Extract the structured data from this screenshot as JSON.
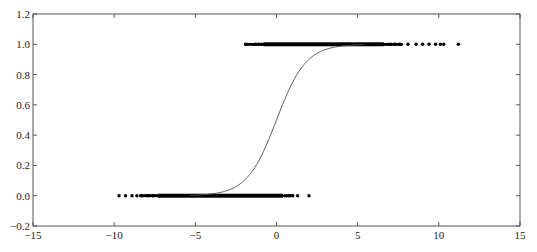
{
  "chart_data": {
    "type": "scatter",
    "title": "",
    "xlabel": "",
    "ylabel": "",
    "xlim": [
      -15,
      15
    ],
    "ylim": [
      -0.2,
      1.2
    ],
    "grid": false,
    "legend": null,
    "x_ticks": [
      -15,
      -10,
      -5,
      0,
      5,
      10,
      15
    ],
    "x_tick_labels": [
      "−15",
      "−10",
      "−5",
      "0",
      "5",
      "10",
      "15"
    ],
    "y_ticks": [
      -0.2,
      0.0,
      0.2,
      0.4,
      0.6,
      0.8,
      1.0,
      1.2
    ],
    "y_tick_labels": [
      "−0.2",
      "0.0",
      "0.2",
      "0.4",
      "0.6",
      "0.8",
      "1.0",
      "1.2"
    ],
    "series": [
      {
        "name": "class-1-points",
        "type": "scatter",
        "y": 1.0,
        "color": "#000000",
        "dense_range": [
          -0.8,
          6.6
        ],
        "sparse_range": [
          -1.9,
          10.3
        ],
        "outliers": [
          -1.9,
          -1.3,
          -1.1,
          -0.9,
          7.0,
          7.3,
          7.6,
          8.1,
          8.6,
          9.0,
          9.4,
          9.8,
          10.1,
          10.3,
          11.2
        ]
      },
      {
        "name": "class-0-points",
        "type": "scatter",
        "y": 0.0,
        "color": "#000000",
        "dense_range": [
          -7.3,
          0.4
        ],
        "sparse_range": [
          -9.7,
          1.0
        ],
        "outliers": [
          -9.7,
          -9.3,
          -8.9,
          -8.6,
          -8.3,
          -7.9,
          -7.6,
          0.6,
          0.8,
          1.0,
          1.3,
          2.0
        ]
      },
      {
        "name": "logistic-fit",
        "type": "line",
        "color": "#555555",
        "function": "1/(1+exp(-k*(x-x0)))",
        "k": 1.1,
        "x0": 0.0,
        "x_range": [
          -5.3,
          5.4
        ],
        "sample_points": [
          {
            "x": -5,
            "y": 0.004
          },
          {
            "x": -3,
            "y": 0.036
          },
          {
            "x": -2,
            "y": 0.1
          },
          {
            "x": -1,
            "y": 0.25
          },
          {
            "x": 0,
            "y": 0.5
          },
          {
            "x": 1,
            "y": 0.75
          },
          {
            "x": 2,
            "y": 0.9
          },
          {
            "x": 3,
            "y": 0.96
          },
          {
            "x": 5,
            "y": 0.996
          }
        ]
      }
    ]
  }
}
